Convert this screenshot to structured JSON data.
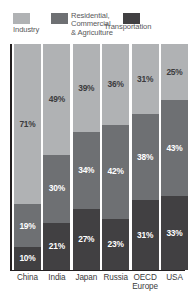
{
  "chart_data": {
    "type": "bar",
    "subtype": "stacked-100-percent",
    "title": "",
    "xlabel": "",
    "ylabel": "",
    "ylim": [
      0,
      100
    ],
    "grid": false,
    "legend_position": "top",
    "categories": [
      "China",
      "India",
      "Japan",
      "Russia",
      "OECD Europe",
      "USA"
    ],
    "category_labels_display": [
      "China",
      "India",
      "Japan",
      "Russia",
      "OECD\nEurope",
      "USA"
    ],
    "series": [
      {
        "name": "Industry",
        "color": "#b0b2b4",
        "values": [
          71,
          49,
          39,
          36,
          31,
          25
        ],
        "value_labels": [
          "71%",
          "49%",
          "39%",
          "36%",
          "31%",
          "25%"
        ]
      },
      {
        "name": "Residential, Commercial & Agriculture",
        "color": "#6e7073",
        "values": [
          19,
          30,
          34,
          42,
          38,
          43
        ],
        "value_labels": [
          "19%",
          "30%",
          "34%",
          "42%",
          "38%",
          "43%"
        ]
      },
      {
        "name": "Transportation",
        "color": "#414042",
        "values": [
          10,
          21,
          27,
          23,
          31,
          33
        ],
        "value_labels": [
          "10%",
          "21%",
          "27%",
          "23%",
          "31%",
          "33%"
        ]
      }
    ]
  },
  "legend": {
    "items": [
      {
        "label": "Industry",
        "color": "#b0b2b4",
        "swatch_name": "legend-swatch-industry"
      },
      {
        "label": "Residential,\nCommercial\n& Agriculture",
        "color": "#6e7073",
        "swatch_name": "legend-swatch-residential"
      },
      {
        "label": "Transportation",
        "color": "#414042",
        "swatch_name": "legend-swatch-transportation"
      }
    ]
  },
  "colors": {
    "industry": "#b0b2b4",
    "residential": "#6e7073",
    "transportation": "#414042",
    "axis": "#231f20",
    "label_text": "#3b3b3d",
    "legend_text": "#58585a",
    "background": "#ffffff"
  }
}
